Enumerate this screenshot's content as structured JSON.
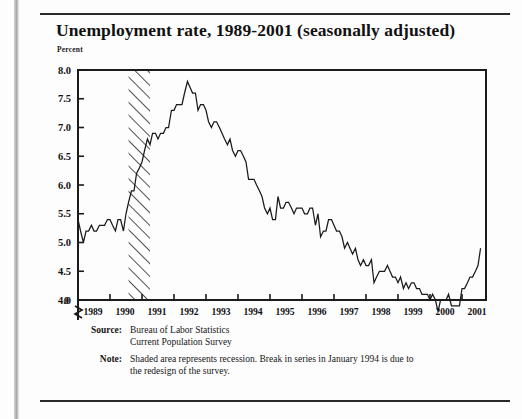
{
  "header": {
    "title": "Unemployment rate, 1989-2001 (seasonally adjusted)",
    "unit_label": "Percent"
  },
  "footnotes": {
    "source_label": "Source:",
    "source_line1": "Bureau of Labor Statistics",
    "source_line2": "Current Population Survey",
    "note_label": "Note:",
    "note_line1": "Shaded area represents recession. Break in series in January 1994 is due to",
    "note_line2": "the redesign of the survey."
  },
  "chart_data": {
    "type": "line",
    "title": "Unemployment rate, 1989-2001 (seasonally adjusted)",
    "xlabel": "",
    "ylabel": "Percent",
    "ylim": [
      4.0,
      8.0
    ],
    "y_axis_break": true,
    "y_break_label": "0",
    "yticks": [
      "8.0",
      "7.5",
      "7.0",
      "6.5",
      "6.0",
      "5.5",
      "5.0",
      "4.5",
      "4.0",
      "0"
    ],
    "ytick_values": [
      8.0,
      7.5,
      7.0,
      6.5,
      6.0,
      5.5,
      5.0,
      4.5,
      4.0,
      0
    ],
    "xticks": [
      "1989",
      "1990",
      "1991",
      "1992",
      "1993",
      "1994",
      "1995",
      "1996",
      "1997",
      "1998",
      "1999",
      "2000",
      "2001"
    ],
    "xlim": [
      1989.0,
      2001.75
    ],
    "grid": false,
    "legend": "none",
    "line_color": "#1a1a1a",
    "shaded_region": {
      "label": "recession",
      "start": 1990.58,
      "end": 1991.25,
      "style": "diagonal-hatch"
    },
    "series": [
      {
        "name": "Unemployment rate",
        "x": [
          1989.0,
          1989.08,
          1989.17,
          1989.25,
          1989.33,
          1989.42,
          1989.5,
          1989.58,
          1989.67,
          1989.75,
          1989.83,
          1989.92,
          1990.0,
          1990.08,
          1990.17,
          1990.25,
          1990.33,
          1990.42,
          1990.5,
          1990.58,
          1990.67,
          1990.75,
          1990.83,
          1990.92,
          1991.0,
          1991.08,
          1991.17,
          1991.25,
          1991.33,
          1991.42,
          1991.5,
          1991.58,
          1991.67,
          1991.75,
          1991.83,
          1991.92,
          1992.0,
          1992.08,
          1992.17,
          1992.25,
          1992.33,
          1992.42,
          1992.5,
          1992.58,
          1992.67,
          1992.75,
          1992.83,
          1992.92,
          1993.0,
          1993.08,
          1993.17,
          1993.25,
          1993.33,
          1993.42,
          1993.5,
          1993.58,
          1993.67,
          1993.75,
          1993.83,
          1993.92,
          1994.0,
          1994.08,
          1994.17,
          1994.25,
          1994.33,
          1994.42,
          1994.5,
          1994.58,
          1994.67,
          1994.75,
          1994.83,
          1994.92,
          1995.0,
          1995.08,
          1995.17,
          1995.25,
          1995.33,
          1995.42,
          1995.5,
          1995.58,
          1995.67,
          1995.75,
          1995.83,
          1995.92,
          1996.0,
          1996.08,
          1996.17,
          1996.25,
          1996.33,
          1996.42,
          1996.5,
          1996.58,
          1996.67,
          1996.75,
          1996.83,
          1996.92,
          1997.0,
          1997.08,
          1997.17,
          1997.25,
          1997.33,
          1997.42,
          1997.5,
          1997.58,
          1997.67,
          1997.75,
          1997.83,
          1997.92,
          1998.0,
          1998.08,
          1998.17,
          1998.25,
          1998.33,
          1998.42,
          1998.5,
          1998.58,
          1998.67,
          1998.75,
          1998.83,
          1998.92,
          1999.0,
          1999.08,
          1999.17,
          1999.25,
          1999.33,
          1999.42,
          1999.5,
          1999.58,
          1999.67,
          1999.75,
          1999.83,
          1999.92,
          2000.0,
          2000.08,
          2000.17,
          2000.25,
          2000.33,
          2000.42,
          2000.5,
          2000.58,
          2000.67,
          2000.75,
          2000.83,
          2000.92,
          2001.0,
          2001.08,
          2001.17,
          2001.25,
          2001.33,
          2001.42,
          2001.5,
          2001.58
        ],
        "y": [
          5.4,
          5.2,
          5.0,
          5.2,
          5.2,
          5.3,
          5.2,
          5.2,
          5.3,
          5.3,
          5.3,
          5.4,
          5.4,
          5.3,
          5.2,
          5.4,
          5.4,
          5.2,
          5.5,
          5.7,
          5.9,
          5.9,
          6.2,
          6.3,
          6.4,
          6.6,
          6.8,
          6.7,
          6.9,
          6.9,
          6.8,
          6.9,
          6.9,
          7.0,
          7.0,
          7.3,
          7.3,
          7.4,
          7.4,
          7.4,
          7.6,
          7.8,
          7.7,
          7.6,
          7.6,
          7.3,
          7.4,
          7.4,
          7.3,
          7.1,
          7.0,
          7.1,
          7.1,
          7.0,
          6.9,
          6.8,
          6.7,
          6.8,
          6.6,
          6.5,
          6.6,
          6.6,
          6.5,
          6.4,
          6.1,
          6.1,
          6.1,
          6.0,
          5.9,
          5.8,
          5.6,
          5.5,
          5.6,
          5.4,
          5.4,
          5.8,
          5.6,
          5.6,
          5.7,
          5.7,
          5.6,
          5.5,
          5.6,
          5.6,
          5.6,
          5.5,
          5.5,
          5.6,
          5.6,
          5.3,
          5.5,
          5.1,
          5.2,
          5.2,
          5.4,
          5.4,
          5.3,
          5.2,
          5.2,
          5.1,
          4.9,
          5.0,
          4.9,
          4.8,
          4.9,
          4.7,
          4.6,
          4.7,
          4.6,
          4.6,
          4.7,
          4.3,
          4.4,
          4.5,
          4.5,
          4.5,
          4.6,
          4.5,
          4.4,
          4.4,
          4.3,
          4.4,
          4.2,
          4.3,
          4.2,
          4.3,
          4.3,
          4.2,
          4.2,
          4.1,
          4.1,
          4.1,
          4.0,
          4.1,
          4.0,
          3.8,
          4.0,
          4.0,
          4.0,
          4.1,
          3.9,
          3.9,
          3.9,
          3.9,
          4.2,
          4.2,
          4.3,
          4.4,
          4.4,
          4.5,
          4.6,
          4.9
        ]
      }
    ]
  }
}
